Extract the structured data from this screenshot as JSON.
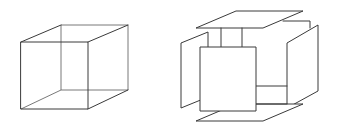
{
  "figure": {
    "title": "Necker cube and exploded plate cube",
    "stroke_color": "#3a3a3a",
    "background": "#ffffff"
  },
  "panels": [
    {
      "id": "wireframe-cube",
      "label": "Necker wireframe cube"
    },
    {
      "id": "exploded-cube",
      "label": "Exploded cube with separated face plates"
    }
  ]
}
